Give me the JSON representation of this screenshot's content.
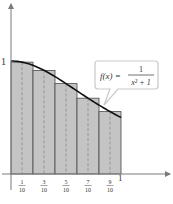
{
  "chart_data": {
    "type": "bar",
    "function_label": "f(x) = 1/(x^2 + 1)",
    "function_label_parts": {
      "lhs": "f(x) =",
      "numerator": "1",
      "denominator": "x² + 1"
    },
    "xlabel": "x",
    "ylabel": "y",
    "xlim": [
      0,
      1
    ],
    "ylim": [
      0,
      1
    ],
    "y_tick_labels": [
      "1"
    ],
    "x_tick_labels": [
      {
        "num": "1",
        "den": "10"
      },
      {
        "num": "3",
        "den": "10"
      },
      {
        "num": "5",
        "den": "10"
      },
      {
        "num": "7",
        "den": "10"
      },
      {
        "num": "9",
        "den": "10"
      }
    ],
    "x_end_label": "1",
    "midpoints": [
      0.1,
      0.3,
      0.5,
      0.7,
      0.9
    ],
    "intervals": [
      [
        0,
        0.2
      ],
      [
        0.2,
        0.4
      ],
      [
        0.4,
        0.6
      ],
      [
        0.6,
        0.8
      ],
      [
        0.8,
        1.0
      ]
    ],
    "values": [
      0.99,
      0.917,
      0.8,
      0.671,
      0.552
    ],
    "colors": {
      "bar_fill": "#c4c4c4",
      "bar_stroke": "#4a4a4a",
      "curve": "#111111",
      "axis": "#6a6a6a",
      "callout_border": "#c9c9c9"
    }
  }
}
